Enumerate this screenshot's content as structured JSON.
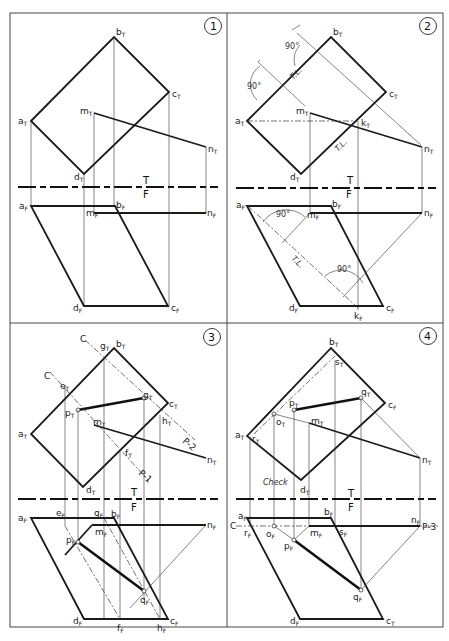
{
  "figure": {
    "panels": [
      {
        "number": "1",
        "fold_labels": {
          "top": "T",
          "bottom": "F"
        },
        "top_view_points": [
          "aT",
          "bT",
          "cT",
          "dT",
          "mT",
          "nT"
        ],
        "front_view_points": [
          "aF",
          "bF",
          "cF",
          "dF",
          "mF",
          "nF"
        ]
      },
      {
        "number": "2",
        "fold_labels": {
          "top": "T",
          "bottom": "F"
        },
        "annotations": [
          "90°",
          "90°",
          "T.L.",
          "T.L.",
          "90°",
          "90°",
          "T.L."
        ],
        "top_view_points": [
          "aT",
          "bT",
          "cT",
          "dT",
          "mT",
          "nT",
          "kT"
        ],
        "front_view_points": [
          "aF",
          "bF",
          "cF",
          "dF",
          "mF",
          "nF",
          "kF"
        ]
      },
      {
        "number": "3",
        "fold_labels": {
          "top": "T",
          "bottom": "F"
        },
        "cutting_planes": [
          "C",
          "C",
          "P-1",
          "P-2"
        ],
        "top_view_points": [
          "aT",
          "bT",
          "cT",
          "dT",
          "mT",
          "nT",
          "eT",
          "gT",
          "pT",
          "fT",
          "hT"
        ],
        "front_view_points": [
          "aF",
          "bF",
          "cF",
          "dF",
          "mF",
          "nF",
          "eF",
          "gF",
          "pF",
          "qF",
          "fF",
          "hF"
        ]
      },
      {
        "number": "4",
        "fold_labels": {
          "top": "T",
          "bottom": "F"
        },
        "cutting_planes": [
          "C",
          "P-3"
        ],
        "check_label": "Check",
        "top_view_points": [
          "aT",
          "bT",
          "cF",
          "dT",
          "mT",
          "nT",
          "pT",
          "qT",
          "oT",
          "rT",
          "sT"
        ],
        "front_view_points": [
          "aF",
          "bF",
          "cT",
          "dF",
          "mF",
          "nF",
          "pF",
          "qF",
          "oF",
          "rF",
          "sF"
        ]
      }
    ]
  },
  "labels": {
    "p1": {
      "num": "1",
      "bT": [
        "b",
        "T"
      ],
      "cT": [
        "c",
        "T"
      ],
      "aT": [
        "a",
        "T"
      ],
      "mT": [
        "m",
        "T"
      ],
      "nT": [
        "n",
        "T"
      ],
      "dT": [
        "d",
        "T"
      ],
      "T": "T",
      "F": "F",
      "aF": [
        "a",
        "F"
      ],
      "bF": [
        "b",
        "F"
      ],
      "mF": [
        "m",
        "F"
      ],
      "nF": [
        "n",
        "F"
      ],
      "dF": [
        "d",
        "F"
      ],
      "cF": [
        "c",
        "F"
      ]
    },
    "p2": {
      "num": "2",
      "bT": [
        "b",
        "T"
      ],
      "cT": [
        "c",
        "T"
      ],
      "aT": [
        "a",
        "T"
      ],
      "mT": [
        "m",
        "T"
      ],
      "kT": [
        "k",
        "T"
      ],
      "nT": [
        "n",
        "T"
      ],
      "dT": [
        "d",
        "T"
      ],
      "ang1": "90°",
      "ang2": "90°",
      "tl1": "T.L.",
      "tl2": "T.L.",
      "T": "T",
      "F": "F",
      "aF": [
        "a",
        "F"
      ],
      "bF": [
        "b",
        "F"
      ],
      "mF": [
        "m",
        "F"
      ],
      "nF": [
        "n",
        "F"
      ],
      "dF": [
        "d",
        "F"
      ],
      "cF": [
        "c",
        "F"
      ],
      "kF": [
        "k",
        "F"
      ],
      "ang3": "90°",
      "ang4": "90°",
      "tl3": "T.L."
    },
    "p3": {
      "num": "3",
      "c1": "C",
      "c2": "C",
      "p1": "P-1",
      "p2": "P-2",
      "bT": [
        "b",
        "T"
      ],
      "gT1": [
        "g",
        "T"
      ],
      "eT": [
        "e",
        "T"
      ],
      "gT2": [
        "g",
        "T"
      ],
      "cT": [
        "c",
        "T"
      ],
      "pT": [
        "p",
        "T"
      ],
      "hT": [
        "h",
        "T"
      ],
      "aT": [
        "a",
        "T"
      ],
      "mT": [
        "m",
        "T"
      ],
      "fT": [
        "f",
        "T"
      ],
      "nT": [
        "n",
        "T"
      ],
      "dT": [
        "d",
        "T"
      ],
      "T": "T",
      "F": "F",
      "aF": [
        "a",
        "F"
      ],
      "eF": [
        "e",
        "F"
      ],
      "gF": [
        "g",
        "F"
      ],
      "bF": [
        "b",
        "F"
      ],
      "nF": [
        "n",
        "F"
      ],
      "mF": [
        "m",
        "F"
      ],
      "pF": [
        "p",
        "F"
      ],
      "qF": [
        "q",
        "F"
      ],
      "dF": [
        "d",
        "F"
      ],
      "fF": [
        "f",
        "F"
      ],
      "hF": [
        "h",
        "F"
      ],
      "cF": [
        "c",
        "F"
      ]
    },
    "p4": {
      "num": "4",
      "bT": [
        "b",
        "T"
      ],
      "sT": [
        "s",
        "T"
      ],
      "qT": [
        "q",
        "T"
      ],
      "cF_top": [
        "c",
        "F"
      ],
      "pT": [
        "p",
        "T"
      ],
      "oT": [
        "o",
        "T"
      ],
      "mT": [
        "m",
        "T"
      ],
      "aT": [
        "a",
        "T"
      ],
      "rT": [
        "r",
        "T"
      ],
      "nT": [
        "n",
        "T"
      ],
      "dT": [
        "d",
        "T"
      ],
      "check": "Check",
      "T": "T",
      "F": "F",
      "aF": [
        "a",
        "F"
      ],
      "bF": [
        "b",
        "F"
      ],
      "C": "C",
      "rF": [
        "r",
        "F"
      ],
      "oF": [
        "o",
        "F"
      ],
      "mF": [
        "m",
        "F"
      ],
      "sF": [
        "s",
        "F"
      ],
      "nF": [
        "n",
        "F"
      ],
      "P3": "P-3",
      "pF": [
        "p",
        "F"
      ],
      "qF": [
        "q",
        "F"
      ],
      "dF": [
        "d",
        "F"
      ],
      "cT_bot": [
        "c",
        "T"
      ]
    }
  }
}
